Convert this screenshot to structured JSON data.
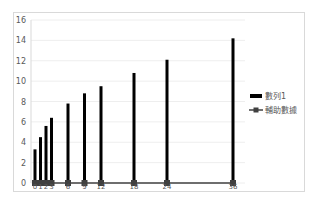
{
  "chart_data": {
    "type": "bar",
    "title": "",
    "xlabel": "",
    "ylabel": "",
    "ylim": [
      0,
      16
    ],
    "yticks": [
      0,
      2,
      4,
      6,
      8,
      10,
      12,
      14,
      16
    ],
    "grid": true,
    "legend_position": "right",
    "x": [
      0,
      1,
      2,
      3,
      6,
      9,
      12,
      18,
      24,
      36
    ],
    "categories": [
      "0",
      "1",
      "2",
      "3",
      "6",
      "9",
      "12",
      "18",
      "24",
      "36"
    ],
    "series": [
      {
        "name": "數列1",
        "type": "bar",
        "color": "#000000",
        "values": [
          3.3,
          4.5,
          5.6,
          6.4,
          7.8,
          8.8,
          9.5,
          10.8,
          12.1,
          14.2
        ]
      },
      {
        "name": "輔助數據",
        "type": "line",
        "marker": "square",
        "color": "#404040",
        "values": [
          0,
          0,
          0,
          0,
          0,
          0,
          0,
          0,
          0,
          0
        ]
      }
    ]
  },
  "legend": {
    "items": [
      {
        "label": "數列1"
      },
      {
        "label": "輔助數據"
      }
    ]
  }
}
